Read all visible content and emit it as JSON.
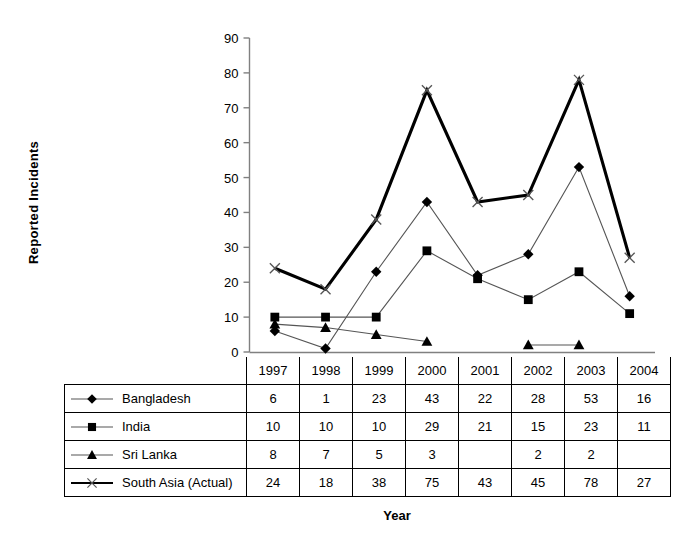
{
  "chart_data": {
    "type": "line",
    "title": "",
    "xlabel": "Year",
    "ylabel": "Reported  Incidents",
    "categories": [
      "1997",
      "1998",
      "1999",
      "2000",
      "2001",
      "2002",
      "2003",
      "2004"
    ],
    "ylim": [
      0,
      90
    ],
    "ytick_step": 10,
    "yticks": [
      "0",
      "10",
      "20",
      "30",
      "40",
      "50",
      "60",
      "70",
      "80",
      "90"
    ],
    "grid": false,
    "legend_position": "table-below",
    "series": [
      {
        "name": "Bangladesh",
        "marker": "diamond",
        "values": [
          6,
          1,
          23,
          43,
          22,
          28,
          53,
          16
        ],
        "display": [
          "6",
          "1",
          "23",
          "43",
          "22",
          "28",
          "53",
          "16"
        ],
        "line_width": 1
      },
      {
        "name": "India",
        "marker": "square",
        "values": [
          10,
          10,
          10,
          29,
          21,
          15,
          23,
          11
        ],
        "display": [
          "10",
          "10",
          "10",
          "29",
          "21",
          "15",
          "23",
          "11"
        ],
        "line_width": 1
      },
      {
        "name": "Sri Lanka",
        "marker": "triangle",
        "values": [
          8,
          7,
          5,
          3,
          null,
          2,
          2,
          null
        ],
        "display": [
          "8",
          "7",
          "5",
          "3",
          "",
          "2",
          "2",
          ""
        ],
        "line_width": 1
      },
      {
        "name": "South Asia (Actual)",
        "marker": "x",
        "values": [
          24,
          18,
          38,
          75,
          43,
          45,
          78,
          27
        ],
        "display": [
          "24",
          "18",
          "38",
          "75",
          "43",
          "45",
          "78",
          "27"
        ],
        "line_width": 3
      }
    ]
  },
  "colors": {
    "line": "#000000",
    "axis": "#808080",
    "grid_border": "#000000",
    "background": "#ffffff"
  }
}
